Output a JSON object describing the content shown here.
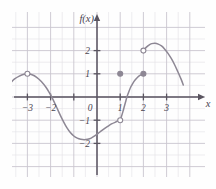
{
  "figure": {
    "kind": "cartesian-graph",
    "y_axis_label": "f(x)",
    "x_axis_label": "x",
    "background_color": "#fefefe",
    "grid_minor_color": "#e3e0e6",
    "grid_major_color": "#c9c5cf",
    "axis_color": "#5a5560",
    "curve_color": "#8d8794",
    "label_color": "#4a4550"
  },
  "chart_data": {
    "type": "line",
    "title": "",
    "subtitle": "",
    "xlabel": "x",
    "ylabel": "f(x)",
    "xlim": [
      -3.95,
      4.15
    ],
    "ylim": [
      -3.3,
      3.25
    ],
    "grid": true,
    "grid_step_minor": 0.5,
    "grid_step_major": 1,
    "legend": "none",
    "x_ticks": [
      -3,
      -2,
      -1,
      0,
      1,
      2,
      3
    ],
    "x_tick_labels": [
      "-3",
      "-2",
      "",
      "0",
      "1",
      "2",
      "3"
    ],
    "y_ticks": [
      -2,
      -1,
      0,
      1,
      2
    ],
    "y_tick_labels": [
      "-2",
      "-1",
      "0",
      "1",
      "2"
    ],
    "series": [
      {
        "name": "left-arc",
        "description": "Arc entering from left, peaks at an open endpoint near (-3, 1), then falls steeply.",
        "points": [
          [
            -3.72,
            0.62
          ],
          [
            -3.55,
            0.78
          ],
          [
            -3.35,
            0.9
          ],
          [
            -3.15,
            0.98
          ],
          [
            -3.0,
            1.0
          ],
          [
            -2.8,
            0.96
          ],
          [
            -2.6,
            0.85
          ],
          [
            -2.4,
            0.67
          ],
          [
            -2.2,
            0.42
          ],
          [
            -2.05,
            0.18
          ],
          [
            -1.9,
            -0.1
          ],
          [
            -1.75,
            -0.42
          ],
          [
            -1.6,
            -0.75
          ],
          [
            -1.45,
            -1.05
          ],
          [
            -1.3,
            -1.32
          ],
          [
            -1.15,
            -1.53
          ],
          [
            -1.0,
            -1.68
          ],
          [
            -0.85,
            -1.77
          ],
          [
            -0.7,
            -1.82
          ],
          [
            -0.55,
            -1.84
          ],
          [
            -0.4,
            -1.82
          ],
          [
            -0.25,
            -1.77
          ],
          [
            -0.1,
            -1.68
          ],
          [
            0.05,
            -1.57
          ],
          [
            0.2,
            -1.45
          ],
          [
            0.35,
            -1.34
          ],
          [
            0.5,
            -1.24
          ],
          [
            0.65,
            -1.15
          ],
          [
            0.8,
            -1.08
          ],
          [
            0.9,
            -1.03
          ],
          [
            1.0,
            -1.0
          ]
        ],
        "start_marker": "none",
        "end_marker": "open"
      },
      {
        "name": "middle-rising-branch",
        "description": "Steeply rising branch from an open endpoint at (1, -1) up to a filled endpoint at (2, 1).",
        "points": [
          [
            1.0,
            -1.0
          ],
          [
            1.06,
            -0.82
          ],
          [
            1.12,
            -0.62
          ],
          [
            1.18,
            -0.4
          ],
          [
            1.24,
            -0.18
          ],
          [
            1.3,
            0.03
          ],
          [
            1.38,
            0.25
          ],
          [
            1.46,
            0.44
          ],
          [
            1.55,
            0.6
          ],
          [
            1.65,
            0.74
          ],
          [
            1.75,
            0.85
          ],
          [
            1.85,
            0.93
          ],
          [
            2.0,
            1.0
          ]
        ],
        "start_marker": "open",
        "end_marker": "filled"
      },
      {
        "name": "right-arc",
        "description": "Arc starting at an open endpoint (2, 2), peaking about 2.3 near x=2.5, descending off to the right.",
        "points": [
          [
            2.0,
            2.0
          ],
          [
            2.12,
            2.14
          ],
          [
            2.24,
            2.24
          ],
          [
            2.36,
            2.3
          ],
          [
            2.5,
            2.32
          ],
          [
            2.64,
            2.28
          ],
          [
            2.78,
            2.2
          ],
          [
            2.92,
            2.06
          ],
          [
            3.06,
            1.88
          ],
          [
            3.2,
            1.66
          ],
          [
            3.34,
            1.4
          ],
          [
            3.48,
            1.1
          ],
          [
            3.62,
            0.78
          ],
          [
            3.72,
            0.52
          ]
        ],
        "start_marker": "open",
        "end_marker": "none"
      }
    ],
    "markers": [
      {
        "name": "open-point-left-peak",
        "x": -3.0,
        "y": 1.0,
        "style": "open"
      },
      {
        "name": "open-point-one-neg-one",
        "x": 1.0,
        "y": -1.0,
        "style": "open"
      },
      {
        "name": "filled-point-isolated",
        "x": 1.0,
        "y": 1.0,
        "style": "filled"
      },
      {
        "name": "filled-point-two-one",
        "x": 2.0,
        "y": 1.0,
        "style": "filled"
      },
      {
        "name": "open-point-two-two",
        "x": 2.0,
        "y": 2.0,
        "style": "open"
      }
    ],
    "annotations": []
  }
}
